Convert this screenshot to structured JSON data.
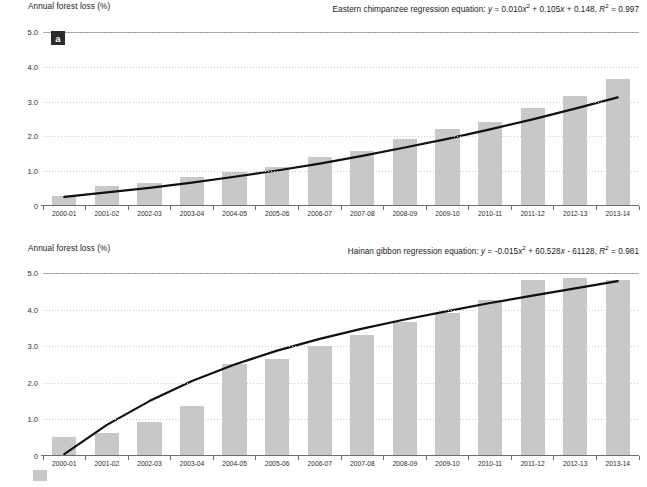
{
  "panels": [
    {
      "tag": "a",
      "axis_title": "Annual forest loss (%)",
      "equation_prefix": "Eastern chimpanzee regression equation:",
      "equation_body": "y = 0.010x2 + 0.105x + 0.148, R2 = 0.997"
    },
    {
      "tag": "b",
      "axis_title": "Annual forest loss (%)",
      "equation_prefix": "Hainan gibbon regression equation:",
      "equation_body": "y = -0.015x2 + 60.528x - 61128, R2 = 0.981"
    }
  ],
  "colors": {
    "bar": "#c8c8c8",
    "curve": "#111111",
    "grid": "#c9c9c9",
    "axis": "#6d6d6d",
    "tag_bg": "#2b2b2b"
  },
  "chart_data": [
    {
      "type": "bar",
      "title": "a",
      "xlabel": "",
      "ylabel": "Annual forest loss (%)",
      "ylim": [
        0,
        5.0
      ],
      "yticks": [
        "0",
        "1.0",
        "2.0",
        "3.0",
        "4.0",
        "5.0"
      ],
      "ytick_values": [
        0,
        1.0,
        2.0,
        3.0,
        4.0,
        5.0
      ],
      "grid": true,
      "legend": "none",
      "annotation": "Eastern chimpanzee regression equation: y = 0.010x2 + 0.105x + 0.148, R2 = 0.997",
      "categories": [
        "2000-01",
        "2001-02",
        "2002-03",
        "2003-04",
        "2004-05",
        "2005-06",
        "2006-07",
        "2007-08",
        "2008-09",
        "2009-10",
        "2010-11",
        "2011-12",
        "2012-13",
        "2013-14"
      ],
      "values": [
        0.25,
        0.55,
        0.65,
        0.8,
        0.95,
        1.1,
        1.4,
        1.55,
        1.9,
        2.2,
        2.4,
        2.8,
        3.15,
        3.65
      ],
      "series": [
        {
          "name": "Eastern chimpanzee regression",
          "type": "line",
          "equation": "y = 0.010x^2 + 0.105x + 0.148",
          "r_squared": 0.997,
          "values": [
            0.26,
            0.39,
            0.52,
            0.67,
            0.84,
            1.02,
            1.22,
            1.44,
            1.68,
            1.93,
            2.2,
            2.49,
            2.8,
            3.12
          ]
        }
      ]
    },
    {
      "type": "bar",
      "title": "b",
      "xlabel": "",
      "ylabel": "Annual forest loss (%)",
      "ylim": [
        0,
        5.0
      ],
      "yticks": [
        "0",
        "1.0",
        "2.0",
        "3.0",
        "4.0",
        "5.0"
      ],
      "ytick_values": [
        0,
        1.0,
        2.0,
        3.0,
        4.0,
        5.0
      ],
      "grid": true,
      "legend": "none",
      "annotation": "Hainan gibbon regression equation: y = -0.015x2 + 60.528x - 61128, R2 = 0.981",
      "categories": [
        "2000-01",
        "2001-02",
        "2002-03",
        "2003-04",
        "2004-05",
        "2005-06",
        "2006-07",
        "2007-08",
        "2008-09",
        "2009-10",
        "2010-11",
        "2011-12",
        "2012-13",
        "2013-14"
      ],
      "values": [
        0.5,
        0.6,
        0.9,
        1.35,
        2.5,
        2.65,
        3.0,
        3.3,
        3.65,
        3.9,
        4.25,
        4.8,
        4.85,
        4.8
      ],
      "series": [
        {
          "name": "Hainan gibbon regression",
          "type": "line",
          "equation": "y = -0.015x^2 + 60.528x - 61128",
          "r_squared": 0.981,
          "values": [
            0.05,
            0.85,
            1.5,
            2.05,
            2.5,
            2.88,
            3.2,
            3.48,
            3.73,
            3.96,
            4.18,
            4.38,
            4.58,
            4.78
          ]
        }
      ]
    }
  ]
}
